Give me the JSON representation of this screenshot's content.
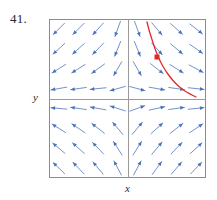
{
  "figure": {
    "problem_number": "41.",
    "x_axis_label": "x",
    "y_axis_label": "y"
  },
  "colors": {
    "vector_arrow": "#4a72b8",
    "solution_curve": "#e02b2b",
    "point_marker": "#e02b2b",
    "frame": "#8c8c8c",
    "axis": "#9a9a9a",
    "background": "#ffffff",
    "text": "#2b2b2b"
  },
  "chart_data": {
    "type": "scatter",
    "title": "",
    "subtitle": "",
    "xlabel": "x",
    "ylabel": "y",
    "grid": false,
    "legend": null,
    "xlim": [
      -4,
      4
    ],
    "ylim": [
      -4,
      4
    ],
    "plot_box_px": {
      "left": 49,
      "top": 19,
      "width": 157,
      "height": 159
    },
    "origin_px": {
      "x": 128,
      "y": 99
    },
    "field": {
      "kind": "direction-field",
      "rows": 8,
      "cols": 8,
      "x_samples": [
        -3.5,
        -2.5,
        -1.5,
        -0.5,
        0.5,
        1.5,
        2.5,
        3.5
      ],
      "y_samples": [
        3.5,
        2.5,
        1.5,
        0.5,
        -0.5,
        -1.5,
        -2.5,
        -3.5
      ],
      "arrow_length_px": 16,
      "arrow_angles_deg": [
        [
          225,
          225,
          228,
          250,
          290,
          310,
          318,
          322
        ],
        [
          222,
          222,
          226,
          248,
          292,
          312,
          320,
          325
        ],
        [
          212,
          212,
          216,
          240,
          300,
          322,
          328,
          332
        ],
        [
          190,
          188,
          186,
          196,
          345,
          350,
          352,
          354
        ],
        [
          175,
          172,
          170,
          162,
          20,
          12,
          8,
          6
        ],
        [
          148,
          146,
          142,
          130,
          50,
          42,
          38,
          34
        ],
        [
          140,
          138,
          134,
          122,
          58,
          50,
          46,
          42
        ],
        [
          136,
          134,
          130,
          118,
          62,
          54,
          50,
          46
        ]
      ],
      "angle_convention": "degrees counter-clockwise from +x axis, arrowhead at the tip"
    },
    "solution_curve": {
      "color": "#e02b2b",
      "quadrant": "first",
      "points_px": [
        [
          147,
          22
        ],
        [
          149,
          30
        ],
        [
          151.5,
          38
        ],
        [
          154,
          46
        ],
        [
          157,
          54
        ],
        [
          160.5,
          62
        ],
        [
          165,
          70
        ],
        [
          170,
          77
        ],
        [
          176,
          84
        ],
        [
          183,
          90
        ],
        [
          190,
          94
        ],
        [
          196,
          97
        ]
      ]
    },
    "marked_point": {
      "px": [
        157,
        57
      ],
      "shape": "square",
      "size_px": 5,
      "color": "#e02b2b"
    }
  }
}
